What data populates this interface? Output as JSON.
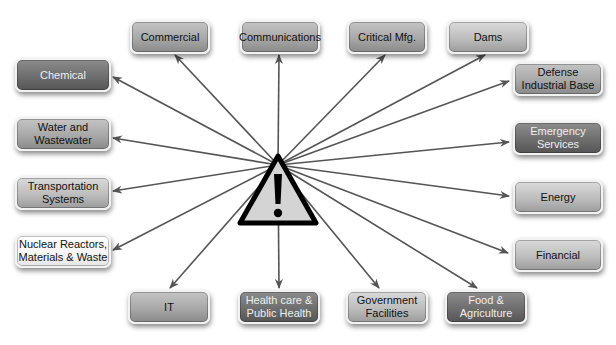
{
  "diagram": {
    "center": {
      "icon": "warning-triangle-icon",
      "glyph": "!"
    },
    "nodes": [
      {
        "id": "commercial",
        "label": "Commercial",
        "style": "mid",
        "x": 130,
        "y": 20,
        "w": 80,
        "h": 34
      },
      {
        "id": "communications",
        "label": "Communications",
        "style": "mid",
        "x": 240,
        "y": 20,
        "w": 80,
        "h": 34
      },
      {
        "id": "critical-mfg",
        "label": "Critical Mfg.",
        "style": "mid",
        "x": 347,
        "y": 20,
        "w": 80,
        "h": 34
      },
      {
        "id": "dams",
        "label": "Dams",
        "style": "light",
        "x": 447,
        "y": 20,
        "w": 82,
        "h": 34
      },
      {
        "id": "chemical",
        "label": "Chemical",
        "style": "dark",
        "x": 15,
        "y": 58,
        "w": 96,
        "h": 34
      },
      {
        "id": "defense",
        "label": "Defense\nIndustrial Base",
        "style": "mid",
        "x": 513,
        "y": 62,
        "w": 90,
        "h": 34
      },
      {
        "id": "water",
        "label": "Water and\nWastewater",
        "style": "mid",
        "x": 15,
        "y": 117,
        "w": 96,
        "h": 34
      },
      {
        "id": "emergency",
        "label": "Emergency\nServices",
        "style": "dark",
        "x": 513,
        "y": 121,
        "w": 90,
        "h": 34
      },
      {
        "id": "transportation",
        "label": "Transportation\nSystems",
        "style": "light",
        "x": 15,
        "y": 176,
        "w": 96,
        "h": 34
      },
      {
        "id": "energy",
        "label": "Energy",
        "style": "light",
        "x": 513,
        "y": 180,
        "w": 90,
        "h": 34
      },
      {
        "id": "nuclear",
        "label": "Nuclear Reactors,\nMaterials & Waste",
        "style": "white",
        "x": 15,
        "y": 234,
        "w": 96,
        "h": 34
      },
      {
        "id": "financial",
        "label": "Financial",
        "style": "light",
        "x": 513,
        "y": 238,
        "w": 90,
        "h": 34
      },
      {
        "id": "it",
        "label": "IT",
        "style": "mid",
        "x": 128,
        "y": 290,
        "w": 82,
        "h": 34
      },
      {
        "id": "healthcare",
        "label": "Health care &\nPublic Health",
        "style": "dark",
        "x": 238,
        "y": 290,
        "w": 82,
        "h": 34
      },
      {
        "id": "government",
        "label": "Government\nFacilities",
        "style": "light",
        "x": 346,
        "y": 290,
        "w": 82,
        "h": 34
      },
      {
        "id": "food",
        "label": "Food &\nAgriculture",
        "style": "dark",
        "x": 445,
        "y": 290,
        "w": 82,
        "h": 34
      }
    ],
    "arrows": [
      {
        "to": "commercial",
        "x2": 175,
        "y2": 55
      },
      {
        "to": "communications",
        "x2": 279,
        "y2": 55
      },
      {
        "to": "critical-mfg",
        "x2": 385,
        "y2": 55
      },
      {
        "to": "dams",
        "x2": 485,
        "y2": 55
      },
      {
        "to": "chemical",
        "x2": 113,
        "y2": 77
      },
      {
        "to": "defense",
        "x2": 509,
        "y2": 81
      },
      {
        "to": "water",
        "x2": 113,
        "y2": 138
      },
      {
        "to": "emergency",
        "x2": 509,
        "y2": 142
      },
      {
        "to": "transportation",
        "x2": 113,
        "y2": 191
      },
      {
        "to": "energy",
        "x2": 509,
        "y2": 196
      },
      {
        "to": "nuclear",
        "x2": 113,
        "y2": 250
      },
      {
        "to": "financial",
        "x2": 508,
        "y2": 253
      },
      {
        "to": "it",
        "x2": 170,
        "y2": 288
      },
      {
        "to": "healthcare",
        "x2": 279,
        "y2": 288
      },
      {
        "to": "government",
        "x2": 379,
        "y2": 288
      },
      {
        "to": "food",
        "x2": 477,
        "y2": 288
      }
    ],
    "hub": {
      "x": 278,
      "y": 165
    },
    "colors": {
      "line": "#555555",
      "triangle_fill": "#d4d4d4",
      "triangle_stroke": "#000000"
    }
  }
}
